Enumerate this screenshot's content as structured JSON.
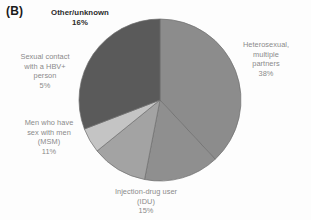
{
  "panel": {
    "label": "(B)"
  },
  "chart_data": {
    "type": "pie",
    "title": "",
    "subtitle": "",
    "xlabel": "",
    "ylabel": "",
    "legend_position": "labels-around-pie",
    "grid": false,
    "categories": [
      "Heterosexual, multiple partners",
      "Injection-drug user (IDU)",
      "Men who have sex with men (MSM)",
      "Sexual contact with a HBV+ person",
      "Other/unknown"
    ],
    "values": [
      38,
      15,
      11,
      5,
      16
    ],
    "value_labels": [
      "38%",
      "15%",
      "11%",
      "5%",
      "16%"
    ],
    "colors": [
      "#8c8c8c",
      "#8f8f8f",
      "#a3a3a3",
      "#c4c4c4",
      "#5a5a5a"
    ],
    "slices": [
      {
        "name": "Heterosexual, multiple partners",
        "label_line1": "Heterosexual,",
        "label_line2": "multiple",
        "label_line3": "partners",
        "percent": "38%",
        "value": 38,
        "color": "#8c8c8c",
        "start_angle": 0,
        "end_angle": 137
      },
      {
        "name": "Injection-drug user (IDU)",
        "label_line1": "Injection-drug user",
        "label_line2": "(IDU)",
        "percent": "15%",
        "value": 15,
        "color": "#8f8f8f",
        "start_angle": 137,
        "end_angle": 191
      },
      {
        "name": "Men who have sex with men (MSM)",
        "label_line1": "Men who have",
        "label_line2": "sex with men",
        "label_line3": "(MSM)",
        "percent": "11%",
        "value": 11,
        "color": "#a3a3a3",
        "start_angle": 191,
        "end_angle": 231
      },
      {
        "name": "Sexual contact with a HBV+ person",
        "label_line1": "Sexual contact",
        "label_line2": "with a HBV+",
        "label_line3": "person",
        "percent": "5%",
        "value": 5,
        "color": "#c4c4c4",
        "start_angle": 231,
        "end_angle": 249
      },
      {
        "name": "Other/unknown",
        "label_line1": "Other/unknown",
        "percent": "16%",
        "value": 16,
        "color": "#5a5a5a",
        "start_angle": 249,
        "end_angle": 360
      }
    ]
  },
  "labels": {
    "other_unknown": "Other/unknown\n16%",
    "sexual_contact": "Sexual contact\nwith a HBV+\nperson\n5%",
    "msm": "Men who have\nsex with men\n(MSM)\n11%",
    "idu": "Injection-drug user\n(IDU)\n15%",
    "heterosexual": "Heterosexual,\nmultiple\npartners\n38%"
  }
}
